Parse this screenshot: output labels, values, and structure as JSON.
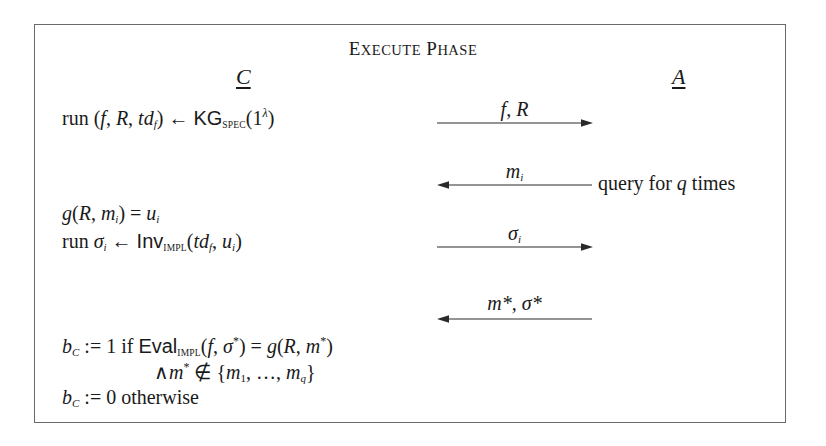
{
  "diagram": {
    "title": {
      "word1_first": "E",
      "word1_rest": "xecute",
      "word2_first": "P",
      "word2_rest": "hase",
      "full": "Execute Phase"
    },
    "parties": {
      "challenger": "C",
      "adversary": "A"
    },
    "challenger_steps": {
      "step1": {
        "prefix": "run (",
        "f": "f",
        "c1": ", ",
        "R": "R",
        "c2": ", ",
        "td": "td",
        "td_sub": "f",
        "close": ") ← ",
        "algo": "KG",
        "algo_sub": "SPEC",
        "arg_open": "(1",
        "arg_sup": "λ",
        "arg_close": ")"
      },
      "step2": {
        "g": "g",
        "open": "(",
        "R": "R",
        "comma": ", ",
        "m": "m",
        "m_sub": "i",
        "close": ") = ",
        "u": "u",
        "u_sub": "i"
      },
      "step3": {
        "prefix": "run ",
        "sigma": "σ",
        "sigma_sub": "i",
        "arrow": " ← ",
        "algo": "Inv",
        "algo_sub": "IMPL",
        "open": "(",
        "td": "td",
        "td_sub": "f",
        "comma": ", ",
        "u": "u",
        "u_sub": "i",
        "close": ")"
      },
      "step4": {
        "b": "b",
        "b_sub": "C",
        "assign": " := 1 if ",
        "algo": "Eval",
        "algo_sub": "IMPL",
        "open": "(",
        "f": "f",
        "comma": ", ",
        "sigma": "σ",
        "sigma_sup": "*",
        "eq": ") = ",
        "g": "g",
        "open2": "(",
        "R": "R",
        "comma2": ", ",
        "m": "m",
        "m_sup": "*",
        "close": ")"
      },
      "step5": {
        "and": "∧",
        "m": "m",
        "m_sup": "*",
        "notin": " ∉ {",
        "m1": "m",
        "m1_sub": "1",
        "dots": ", …, ",
        "mq": "m",
        "mq_sub": "q",
        "close": "}"
      },
      "step6": {
        "b": "b",
        "b_sub": "C",
        "rest": " := 0 otherwise"
      }
    },
    "messages": [
      {
        "label": "f, R",
        "direction": "right"
      },
      {
        "label_base": "m",
        "label_sub": "i",
        "direction": "left",
        "note_prefix": "query for ",
        "note_var": "q",
        "note_suffix": " times"
      },
      {
        "label_base": "σ",
        "label_sub": "i",
        "direction": "right"
      },
      {
        "label": "m*, σ*",
        "direction": "left"
      }
    ],
    "colors": {
      "frame": "#6a6a6a",
      "text": "#1a1a1a",
      "arrow": "#2a2a2a"
    }
  }
}
